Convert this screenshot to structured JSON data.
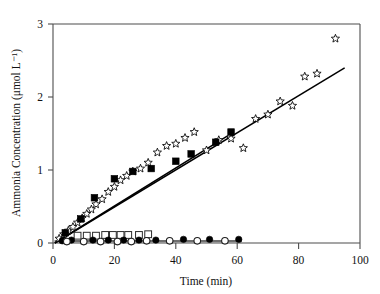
{
  "chart_data": {
    "type": "scatter",
    "title": "",
    "xlabel": "Time (min)",
    "ylabel": "Ammonia Concentration (μmol L⁻¹)",
    "xlim": [
      0,
      100
    ],
    "ylim": [
      0,
      3
    ],
    "xticks": [
      0,
      20,
      40,
      60,
      80,
      100
    ],
    "yticks": [
      0,
      1,
      2,
      3
    ],
    "xtick_labels": [
      "0",
      "20",
      "40",
      "60",
      "80",
      "100"
    ],
    "ytick_labels": [
      "0",
      "1",
      "2",
      "3"
    ],
    "grid": false,
    "legend": "none",
    "series": [
      {
        "name": "star-series",
        "marker": "open-star",
        "points": [
          [
            2.0,
            0.06
          ],
          [
            3.5,
            0.12
          ],
          [
            5.0,
            0.17
          ],
          [
            6.5,
            0.22
          ],
          [
            8.0,
            0.28
          ],
          [
            9.5,
            0.34
          ],
          [
            11.0,
            0.4
          ],
          [
            12.5,
            0.46
          ],
          [
            14.0,
            0.53
          ],
          [
            16.0,
            0.6
          ],
          [
            18.0,
            0.7
          ],
          [
            20.0,
            0.77
          ],
          [
            22.0,
            0.86
          ],
          [
            24.0,
            0.92
          ],
          [
            26.0,
            0.98
          ],
          [
            28.5,
            1.02
          ],
          [
            31.0,
            1.1
          ],
          [
            34.0,
            1.24
          ],
          [
            37.0,
            1.33
          ],
          [
            40.0,
            1.36
          ],
          [
            43.0,
            1.44
          ],
          [
            46.0,
            1.52
          ],
          [
            50.0,
            1.27
          ],
          [
            54.0,
            1.41
          ],
          [
            58.0,
            1.43
          ],
          [
            62.0,
            1.3
          ],
          [
            66.0,
            1.7
          ],
          [
            70.0,
            1.76
          ],
          [
            74.0,
            1.94
          ],
          [
            78.0,
            1.88
          ],
          [
            82.0,
            2.28
          ],
          [
            86.0,
            2.32
          ],
          [
            92.0,
            2.8
          ]
        ]
      },
      {
        "name": "filled-square-series",
        "marker": "filled-square",
        "points": [
          [
            4.0,
            0.14
          ],
          [
            9.0,
            0.33
          ],
          [
            13.5,
            0.62
          ],
          [
            20.0,
            0.88
          ],
          [
            26.0,
            0.98
          ],
          [
            32.0,
            1.02
          ],
          [
            40.0,
            1.12
          ],
          [
            45.0,
            1.22
          ],
          [
            53.0,
            1.38
          ],
          [
            58.0,
            1.52
          ]
        ]
      },
      {
        "name": "open-square-series",
        "marker": "open-square",
        "points": [
          [
            8.0,
            0.1
          ],
          [
            11.0,
            0.1
          ],
          [
            14.0,
            0.1
          ],
          [
            17.0,
            0.11
          ],
          [
            19.5,
            0.11
          ],
          [
            22.0,
            0.11
          ],
          [
            24.5,
            0.11
          ],
          [
            28.0,
            0.11
          ],
          [
            31.0,
            0.12
          ]
        ]
      },
      {
        "name": "filled-circle-series",
        "marker": "filled-circle",
        "points": [
          [
            3.0,
            0.03
          ],
          [
            6.0,
            0.04
          ],
          [
            13.0,
            0.04
          ],
          [
            18.0,
            0.04
          ],
          [
            23.0,
            0.04
          ],
          [
            28.0,
            0.04
          ],
          [
            33.5,
            0.04
          ],
          [
            42.5,
            0.05
          ],
          [
            51.0,
            0.05
          ],
          [
            60.5,
            0.05
          ]
        ]
      },
      {
        "name": "open-circle-series",
        "marker": "open-circle",
        "points": [
          [
            4.5,
            0.02
          ],
          [
            10.0,
            0.02
          ],
          [
            15.5,
            0.02
          ],
          [
            21.0,
            0.02
          ],
          [
            25.5,
            0.02
          ],
          [
            30.5,
            0.03
          ],
          [
            38.0,
            0.03
          ],
          [
            47.0,
            0.03
          ],
          [
            56.0,
            0.03
          ]
        ]
      }
    ],
    "fit_lines": [
      {
        "name": "star-fit-line",
        "x_start": 0.6,
        "y_start": 0.0,
        "x_end": 95.0,
        "y_end": 2.4
      },
      {
        "name": "square-fit-line",
        "x_start": 0.6,
        "y_start": 0.0,
        "x_end": 57.0,
        "y_end": 1.47
      }
    ],
    "baseline_trace": {
      "name": "baseline-trace",
      "x_start": 0.5,
      "x_end": 61.5,
      "y": 0.025
    },
    "colors": {
      "marker_stroke": "#000000",
      "marker_fill_open": "#ffffff",
      "fit_line": "#000000",
      "frame": "#4d4d4d",
      "baseline": "#6e6e6e",
      "text": "#111111",
      "background": "#ffffff"
    }
  }
}
